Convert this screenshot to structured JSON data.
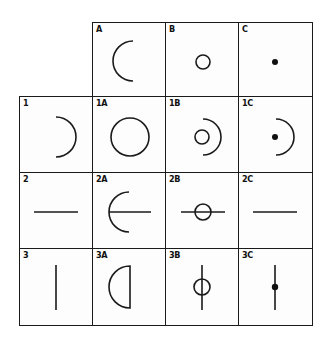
{
  "diagram": {
    "type": "combination-matrix",
    "column_headers": [
      {
        "id": "A",
        "label": "A",
        "glyph": "left-arc"
      },
      {
        "id": "B",
        "label": "B",
        "glyph": "small-circle"
      },
      {
        "id": "C",
        "label": "C",
        "glyph": "dot"
      }
    ],
    "row_headers": [
      {
        "id": "1",
        "label": "1",
        "glyph": "right-arc"
      },
      {
        "id": "2",
        "label": "2",
        "glyph": "horizontal-line"
      },
      {
        "id": "3",
        "label": "3",
        "glyph": "vertical-line"
      }
    ],
    "cells": [
      {
        "id": "1A",
        "label": "1A",
        "glyph": "full-circle"
      },
      {
        "id": "1B",
        "label": "1B",
        "glyph": "small-circle-with-right-arc"
      },
      {
        "id": "1C",
        "label": "1C",
        "glyph": "dot-with-right-arc"
      },
      {
        "id": "2A",
        "label": "2A",
        "glyph": "left-arc-with-horizontal-line"
      },
      {
        "id": "2B",
        "label": "2B",
        "glyph": "small-circle-on-horizontal-line"
      },
      {
        "id": "2C",
        "label": "2C",
        "glyph": "horizontal-line"
      },
      {
        "id": "3A",
        "label": "3A",
        "glyph": "left-half-disc-outline"
      },
      {
        "id": "3B",
        "label": "3B",
        "glyph": "small-circle-on-vertical-line"
      },
      {
        "id": "3C",
        "label": "3C",
        "glyph": "dot-on-vertical-line"
      }
    ]
  },
  "colors": {
    "stroke": "#1a1a1a",
    "background": "#ffffff"
  }
}
